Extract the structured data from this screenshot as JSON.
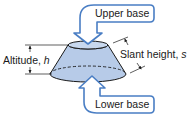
{
  "figure": {
    "colors": {
      "fill": "#b7cbe8",
      "fill_dark": "#9fb8de",
      "outline": "#1a1a1a",
      "callout_stroke": "#4a7ec4",
      "callout_fill": "#ffffff",
      "background": "#ffffff"
    }
  },
  "labels": {
    "upper_base": "Upper base",
    "lower_base": "Lower base",
    "altitude_text": "Altitude, ",
    "altitude_var": "h",
    "slant_text": "Slant height, ",
    "slant_var": "s"
  }
}
